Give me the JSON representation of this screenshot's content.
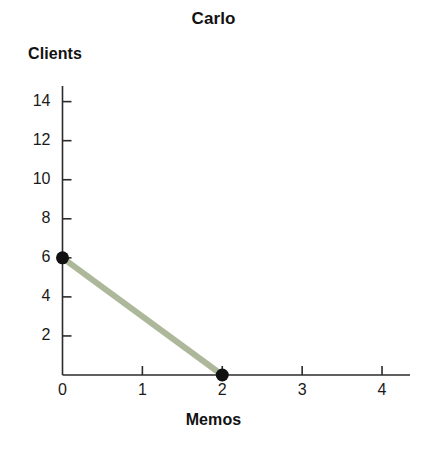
{
  "chart_data": {
    "type": "line",
    "title": "Carlo",
    "xlabel": "Memos",
    "ylabel": "Clients",
    "grid": false,
    "legend": "none",
    "xlim": [
      0,
      4.35
    ],
    "ylim": [
      0,
      14.8
    ],
    "xticks": [
      0,
      1,
      2,
      3,
      4
    ],
    "xtick_labels": [
      "0",
      "1",
      "2",
      "3",
      "4"
    ],
    "yticks": [
      2,
      4,
      6,
      8,
      10,
      12,
      14
    ],
    "ytick_labels": [
      "2",
      "4",
      "6",
      "8",
      "10",
      "12",
      "14"
    ],
    "series": [
      {
        "name": "Carlo production possibilities frontier",
        "color": "#adb89a",
        "line_width": 6,
        "marker": "filled-circle",
        "marker_color": "#111111",
        "x": [
          0,
          2
        ],
        "y": [
          6,
          0
        ],
        "points": [
          {
            "x": 0,
            "y": 6,
            "label": "(0, 6)"
          },
          {
            "x": 2,
            "y": 0,
            "label": "(2, 0)"
          }
        ]
      }
    ],
    "annotations": []
  },
  "colors": {
    "background": "#ffffff",
    "axis": "#2b2b2b",
    "text": "#121212",
    "tick_text": "#1a1a1a",
    "line": "#adb89a",
    "marker": "#111111"
  },
  "axes": {
    "y_axis_name": "y-axis",
    "x_axis_name": "x-axis"
  }
}
